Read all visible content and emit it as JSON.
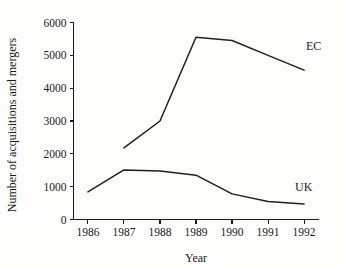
{
  "chart_data": {
    "type": "line",
    "title": "",
    "xlabel": "Year",
    "ylabel": "Number of acquisitions and mergers",
    "x": [
      1986,
      1987,
      1988,
      1989,
      1990,
      1991,
      1992
    ],
    "xtick_labels": [
      "1986",
      "1987",
      "1988",
      "1989",
      "1990",
      "1991",
      "1992"
    ],
    "ytick_labels": [
      "0",
      "1000",
      "2000",
      "3000",
      "4000",
      "5000",
      "6000"
    ],
    "yticks": [
      0,
      1000,
      2000,
      3000,
      4000,
      5000,
      6000
    ],
    "xlim": [
      1985.6,
      1992.4
    ],
    "ylim": [
      0,
      6000
    ],
    "grid": false,
    "legend_position": "inline-right",
    "series": [
      {
        "name": "EC",
        "label": "EC",
        "color": "#20201e",
        "x": [
          1987,
          1988,
          1989,
          1990,
          1991,
          1992
        ],
        "values": [
          2180,
          3000,
          5550,
          5450,
          5000,
          4550
        ]
      },
      {
        "name": "UK",
        "label": "UK",
        "color": "#20201e",
        "x": [
          1986,
          1987,
          1988,
          1989,
          1990,
          1991,
          1992
        ],
        "values": [
          840,
          1510,
          1480,
          1350,
          780,
          550,
          470
        ]
      }
    ],
    "annotations": [
      {
        "text": "EC",
        "x": 1992.05,
        "y": 5150
      },
      {
        "text": "UK",
        "x": 1991.75,
        "y": 880
      }
    ]
  },
  "colors": {
    "background": "#fdfdfc",
    "axis": "#1a1a1a",
    "line": "#20201e"
  }
}
